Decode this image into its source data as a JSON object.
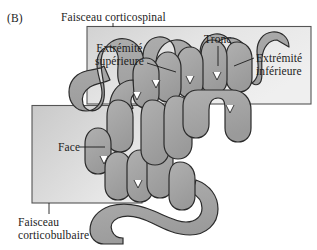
{
  "figure": {
    "panel_letter": "(B)",
    "type": "anatomical-diagram",
    "language": "fr"
  },
  "labels": {
    "corticospinal": "Faisceau corticospinal",
    "corticobulbaire_line1": "Faisceau",
    "corticobulbaire_line2": "corticobulbaire",
    "extremite_superieure_line1": "Extrémité",
    "extremite_superieure_line2": "supérieure",
    "tronc": "Tronc",
    "extremite_inferieure_line1": "Extrémité",
    "extremite_inferieure_line2": "inférieure",
    "face": "Face"
  },
  "colors": {
    "gyrus_fill": "#a8a8a8",
    "gyrus_stroke": "#2b2b2b",
    "box_fill_light": "#e6e6e6",
    "box_fill_dark": "#c4c4c4",
    "box_stroke": "#4a4a4a",
    "text": "#1c1c1c",
    "background": "#ffffff"
  },
  "regions": [
    {
      "name": "corticospinal-region",
      "label": "Faisceau corticospinal",
      "contains": [
        "Extrémité supérieure",
        "Tronc",
        "Extrémité inférieure"
      ]
    },
    {
      "name": "corticobulbaire-region",
      "label": "Faisceau corticobulbaire",
      "contains": [
        "Face"
      ]
    }
  ]
}
